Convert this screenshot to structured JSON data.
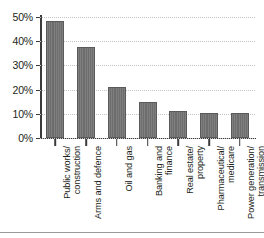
{
  "chart_data": {
    "type": "bar",
    "title": "",
    "xlabel": "",
    "ylabel": "",
    "ylim": [
      0,
      50
    ],
    "ytick_step": 10,
    "ytick_labels": [
      "0%",
      "10%",
      "20%",
      "30%",
      "40%",
      "50%"
    ],
    "ytick_values": [
      0,
      10,
      20,
      30,
      40,
      50
    ],
    "grid": "horizontal-dotted",
    "legend": "none",
    "bar_color": "#6d6d6d",
    "bar_edge_color": "#5a5a5a",
    "axis_color": "#3b3b3b",
    "gridline_color": "#c3c3c3",
    "categories": [
      "Public works/ construction",
      "Arms and defence",
      "Oil and gas",
      "Banking and finance",
      "Real estate/ property",
      "Pharmaceutical/ medicare",
      "Power generation/ transmission"
    ],
    "category_lines": [
      [
        "Public works/",
        "construction"
      ],
      [
        "Arms and defence"
      ],
      [
        "Oil and gas"
      ],
      [
        "Banking and",
        "finance"
      ],
      [
        "Real estate/",
        "property"
      ],
      [
        "Pharmaceutical/",
        "medicare"
      ],
      [
        "Power generation/",
        "transmission"
      ]
    ],
    "values": [
      48.3,
      37.5,
      21.0,
      15.0,
      11.0,
      10.5,
      10.5
    ],
    "value_labels": [
      "48%",
      "38%",
      "21%",
      "15%",
      "11%",
      "10%",
      "10%"
    ]
  }
}
